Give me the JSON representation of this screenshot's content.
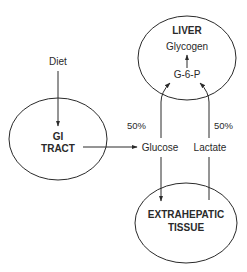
{
  "nodes": {
    "liver": {
      "title": "LIVER",
      "glycogen": "Glycogen",
      "g6p": "G-6-P"
    },
    "gi_tract": {
      "line1": "GI",
      "line2": "TRACT"
    },
    "extrahepatic": {
      "line1": "EXTRAHEPATIC",
      "line2": "TISSUE"
    }
  },
  "labels": {
    "diet": "Diet",
    "glucose": "Glucose",
    "lactate": "Lactate",
    "glucose_pct": "50%",
    "lactate_pct": "50%"
  },
  "colors": {
    "stroke": "#2a2a2a",
    "background": "#ffffff"
  }
}
